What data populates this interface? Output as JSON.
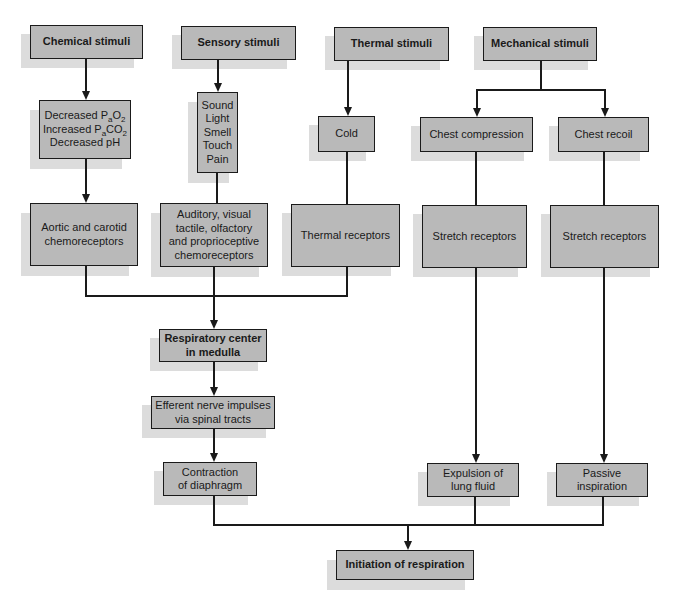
{
  "diagram": {
    "type": "flowchart",
    "nodes": {
      "chemical_stimuli": "Chemical stimuli",
      "sensory_stimuli": "Sensory stimuli",
      "thermal_stimuli": "Thermal stimuli",
      "mechanical_stimuli": "Mechanical stimuli",
      "chemical_changes": {
        "line1_pre": "Decreased P",
        "line1_sub": "a",
        "line1_post": "O",
        "line1_sub2": "2",
        "line2_pre": "Increased P",
        "line2_sub": "a",
        "line2_post": "CO",
        "line2_sub2": "2",
        "line3": "Decreased pH"
      },
      "sensory_list": [
        "Sound",
        "Light",
        "Smell",
        "Touch",
        "Pain"
      ],
      "cold": "Cold",
      "chest_compression": "Chest compression",
      "chest_recoil": "Chest recoil",
      "aortic_carotid": [
        "Aortic and carotid",
        "chemoreceptors"
      ],
      "auditory_visual": [
        "Auditory, visual",
        "tactile, olfactory",
        "and proprioceptive",
        "chemoreceptors"
      ],
      "thermal_receptors": "Thermal receptors",
      "stretch_receptors_1": "Stretch receptors",
      "stretch_receptors_2": "Stretch receptors",
      "respiratory_center": [
        "Respiratory center",
        "in medulla"
      ],
      "efferent_impulses": [
        "Efferent nerve impulses",
        "via spinal tracts"
      ],
      "contraction_diaphragm": [
        "Contraction",
        "of diaphragm"
      ],
      "expulsion_fluid": [
        "Expulsion of",
        "lung fluid"
      ],
      "passive_inspiration": [
        "Passive",
        "inspiration"
      ],
      "initiation_respiration": "Initiation of respiration"
    },
    "edges": [
      [
        "Chemical stimuli",
        "Decreased PaO2 / Increased PaCO2 / Decreased pH"
      ],
      [
        "Decreased PaO2 / Increased PaCO2 / Decreased pH",
        "Aortic and carotid chemoreceptors"
      ],
      [
        "Sensory stimuli",
        "Sound / Light / Smell / Touch / Pain"
      ],
      [
        "Sound / Light / Smell / Touch / Pain",
        "Auditory, visual tactile, olfactory and proprioceptive chemoreceptors"
      ],
      [
        "Thermal stimuli",
        "Cold"
      ],
      [
        "Cold",
        "Thermal receptors"
      ],
      [
        "Mechanical stimuli",
        "Chest compression"
      ],
      [
        "Mechanical stimuli",
        "Chest recoil"
      ],
      [
        "Chest compression",
        "Stretch receptors"
      ],
      [
        "Chest recoil",
        "Stretch receptors"
      ],
      [
        "Aortic and carotid chemoreceptors",
        "Respiratory center in medulla"
      ],
      [
        "Auditory, visual tactile, olfactory and proprioceptive chemoreceptors",
        "Respiratory center in medulla"
      ],
      [
        "Thermal receptors",
        "Respiratory center in medulla"
      ],
      [
        "Respiratory center in medulla",
        "Efferent nerve impulses via spinal tracts"
      ],
      [
        "Efferent nerve impulses via spinal tracts",
        "Contraction of diaphragm"
      ],
      [
        "Stretch receptors",
        "Expulsion of lung fluid"
      ],
      [
        "Stretch receptors",
        "Passive inspiration"
      ],
      [
        "Contraction of diaphragm",
        "Initiation of respiration"
      ],
      [
        "Expulsion of lung fluid",
        "Initiation of respiration"
      ],
      [
        "Passive inspiration",
        "Initiation of respiration"
      ]
    ],
    "colors": {
      "box_fill": "#b9b9b9",
      "box_shadow": "#dcdcdc",
      "line": "#1a1a1a"
    }
  }
}
